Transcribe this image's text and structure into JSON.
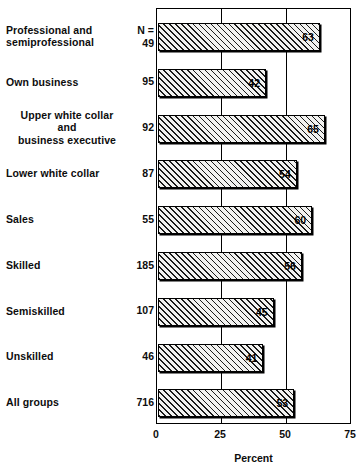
{
  "chart_data": {
    "type": "bar",
    "orientation": "horizontal",
    "title": "",
    "xlabel": "Percent",
    "ylabel": "",
    "xlim": [
      0,
      75
    ],
    "xticks": [
      0,
      25,
      50,
      75
    ],
    "xtick_labels": [
      "0",
      "25",
      "50",
      "75"
    ],
    "grid": true,
    "grid_axis": "x",
    "legend": null,
    "n_header": "N =",
    "categories": [
      "Professional and semiprofessional",
      "Own business",
      "Upper white collar and business executive",
      "Lower white collar",
      "Sales",
      "Skilled",
      "Semiskilled",
      "Unskilled",
      "All groups"
    ],
    "n_values": [
      49,
      95,
      92,
      87,
      55,
      185,
      107,
      46,
      716
    ],
    "values": [
      63,
      42,
      65,
      54,
      60,
      56,
      45,
      41,
      53
    ]
  },
  "rows": [
    {
      "label_lines": [
        "Professional and",
        "semiprofessional"
      ],
      "align": "left",
      "n": "49",
      "n_prefix": "N =",
      "value": 63,
      "value_label": "63"
    },
    {
      "label_lines": [
        "Own business"
      ],
      "align": "left",
      "n": "95",
      "n_prefix": "",
      "value": 42,
      "value_label": "42"
    },
    {
      "label_lines": [
        "Upper white collar",
        "and",
        "business executive"
      ],
      "align": "center",
      "n": "92",
      "n_prefix": "",
      "value": 65,
      "value_label": "65"
    },
    {
      "label_lines": [
        "Lower white collar"
      ],
      "align": "left",
      "n": "87",
      "n_prefix": "",
      "value": 54,
      "value_label": "54"
    },
    {
      "label_lines": [
        "Sales"
      ],
      "align": "left",
      "n": "55",
      "n_prefix": "",
      "value": 60,
      "value_label": "60"
    },
    {
      "label_lines": [
        "Skilled"
      ],
      "align": "left",
      "n": "185",
      "n_prefix": "",
      "value": 56,
      "value_label": "56"
    },
    {
      "label_lines": [
        "Semiskilled"
      ],
      "align": "left",
      "n": "107",
      "n_prefix": "",
      "value": 45,
      "value_label": "45"
    },
    {
      "label_lines": [
        "Unskilled"
      ],
      "align": "left",
      "n": "46",
      "n_prefix": "",
      "value": 41,
      "value_label": "41"
    },
    {
      "label_lines": [
        "All groups"
      ],
      "align": "left",
      "n": "716",
      "n_prefix": "",
      "value": 53,
      "value_label": "53"
    }
  ],
  "axis": {
    "x_title": "Percent",
    "ticks": [
      "0",
      "25",
      "50",
      "75"
    ]
  },
  "colors": {
    "ink": "#000000",
    "bar_fill": "#f2f2f0",
    "hatch": "#1a1a1a",
    "background": "#ffffff"
  }
}
